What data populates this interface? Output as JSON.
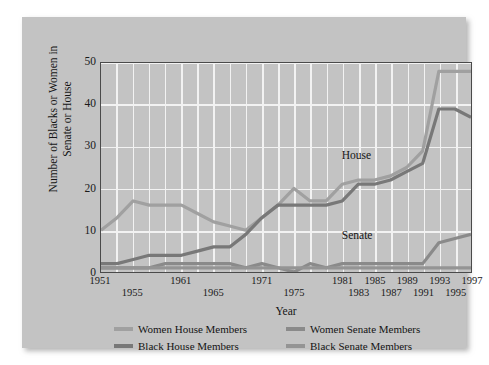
{
  "figure": {
    "panel_bg": "#c3c3c3",
    "page_bg": "#ffffff",
    "plot_border_color": "#4a4a4a",
    "grid_color": "#f2f2f2"
  },
  "annotations": {
    "house_label": "House",
    "senate_label": "Senate"
  },
  "legend": {
    "position": "below-axis",
    "entries": [
      {
        "label": "Women House Members",
        "color": "#a0a0a0"
      },
      {
        "label": "Women Senate Members",
        "color": "#8a8a8a"
      },
      {
        "label": "Black House Members",
        "color": "#787878"
      },
      {
        "label": "Black Senate Members",
        "color": "#949494"
      }
    ]
  },
  "chart_data": {
    "type": "line",
    "title": "",
    "subtitle": "",
    "xlabel": "Year",
    "ylabel": "Number of Blacks or Women in Senate or House",
    "xlim": [
      1951,
      1997
    ],
    "ylim": [
      0,
      50
    ],
    "grid": true,
    "yticks": [
      0,
      10,
      20,
      30,
      40,
      50
    ],
    "ytick_labels": [
      "0",
      "10",
      "20",
      "30",
      "40",
      "50"
    ],
    "xticks": [
      1951,
      1953,
      1955,
      1957,
      1959,
      1961,
      1963,
      1965,
      1967,
      1969,
      1971,
      1973,
      1975,
      1977,
      1979,
      1981,
      1983,
      1985,
      1987,
      1989,
      1991,
      1993,
      1995,
      1997
    ],
    "xtick_labels_top": [
      "1951",
      "1961",
      "1971",
      "1981",
      "1985",
      "1989",
      "1993",
      "1997"
    ],
    "xtick_labels_bottom": [
      "1955",
      "1965",
      "1975",
      "1983",
      "1987",
      "1991",
      "1995"
    ],
    "x": [
      1951,
      1953,
      1955,
      1957,
      1959,
      1961,
      1963,
      1965,
      1967,
      1969,
      1971,
      1973,
      1975,
      1977,
      1979,
      1981,
      1983,
      1985,
      1987,
      1989,
      1991,
      1993,
      1995,
      1997
    ],
    "series": [
      {
        "name": "Women House Members",
        "color": "#a0a0a0",
        "values": [
          10,
          13,
          17,
          16,
          16,
          16,
          14,
          12,
          11,
          10,
          13,
          16,
          20,
          17,
          17,
          21,
          22,
          22,
          23,
          25,
          29,
          48,
          48,
          48
        ]
      },
      {
        "name": "Black House Members",
        "color": "#787878",
        "values": [
          2,
          2,
          3,
          4,
          4,
          4,
          5,
          6,
          6,
          9,
          13,
          16,
          16,
          16,
          16,
          17,
          21,
          21,
          22,
          24,
          26,
          39,
          39,
          37
        ]
      },
      {
        "name": "Women Senate Members",
        "color": "#8a8a8a",
        "values": [
          1,
          1,
          1,
          1,
          2,
          2,
          2,
          2,
          2,
          1,
          2,
          1,
          0,
          2,
          1,
          2,
          2,
          2,
          2,
          2,
          2,
          7,
          8,
          9
        ]
      },
      {
        "name": "Black Senate Members",
        "color": "#949494",
        "values": [
          1,
          1,
          1,
          1,
          1,
          1,
          1,
          1,
          1,
          1,
          1,
          1,
          1,
          1,
          1,
          1,
          1,
          1,
          1,
          1,
          1,
          1,
          1,
          1
        ]
      }
    ]
  }
}
